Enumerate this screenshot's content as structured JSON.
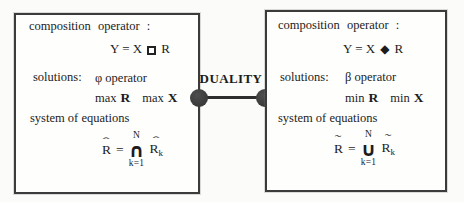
{
  "colors": {
    "background": "#fbfbf9",
    "ink": "#1c1c1c",
    "panel_border": "#3b3b3b",
    "node_fill": "#3a3a3a"
  },
  "duality": {
    "label": "DUALITY"
  },
  "left": {
    "composition_label": "composition operator :",
    "composition": {
      "prefix": "Y = X",
      "operator_icon": "open-square",
      "suffix": "R"
    },
    "solutions_label": "solutions:",
    "operator_name": "φ operator",
    "optimization": [
      {
        "prefix": "max",
        "var": "R"
      },
      {
        "prefix": "max",
        "var": "X"
      }
    ],
    "system_label": "system of equations",
    "equation": {
      "lhs_letter": "R",
      "lhs_accent": "ˆ",
      "equals": "=",
      "big_operator": "∩",
      "upper_limit": "N",
      "lower_limit": "k=1",
      "rhs_letter": "R",
      "rhs_accent": "ˆ",
      "rhs_subscript": "k"
    }
  },
  "right": {
    "composition_label": "composition operator :",
    "composition": {
      "prefix": "Y = X",
      "operator_symbol": "◆",
      "suffix": "R"
    },
    "solutions_label": "solutions:",
    "operator_name": "β operator",
    "optimization": [
      {
        "prefix": "min",
        "var": "R"
      },
      {
        "prefix": "min",
        "var": "X"
      }
    ],
    "system_label": "system of equations",
    "equation": {
      "lhs_letter": "R",
      "lhs_accent": "˜",
      "equals": "=",
      "big_operator": "∪",
      "upper_limit": "N",
      "lower_limit": "k=1",
      "rhs_letter": "R",
      "rhs_accent": "˜",
      "rhs_subscript": "k"
    }
  }
}
